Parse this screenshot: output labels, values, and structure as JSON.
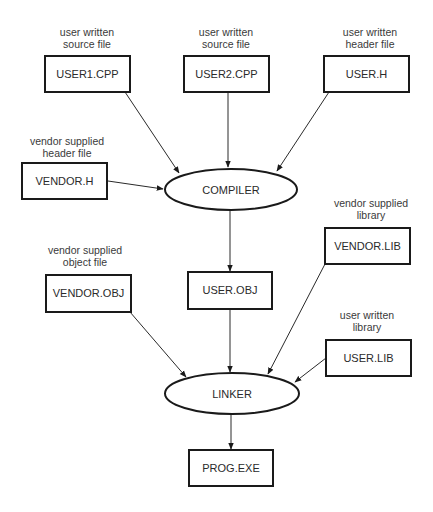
{
  "diagram": {
    "type": "flowchart",
    "title": "",
    "nodes": {
      "user1_cpp": {
        "label": "USER1.CPP",
        "shape": "rect",
        "caption": [
          "user written",
          "source file"
        ]
      },
      "user2_cpp": {
        "label": "USER2.CPP",
        "shape": "rect",
        "caption": [
          "user written",
          "source file"
        ]
      },
      "user_h": {
        "label": "USER.H",
        "shape": "rect",
        "caption": [
          "user written",
          "header file"
        ]
      },
      "vendor_h": {
        "label": "VENDOR.H",
        "shape": "rect",
        "caption": [
          "vendor supplied",
          "header file"
        ]
      },
      "compiler": {
        "label": "COMPILER",
        "shape": "ellipse"
      },
      "vendor_lib": {
        "label": "VENDOR.LIB",
        "shape": "rect",
        "caption": [
          "vendor supplied",
          "library"
        ]
      },
      "vendor_obj": {
        "label": "VENDOR.OBJ",
        "shape": "rect",
        "caption": [
          "vendor supplied",
          "object file"
        ]
      },
      "user_obj": {
        "label": "USER.OBJ",
        "shape": "rect"
      },
      "user_lib": {
        "label": "USER.LIB",
        "shape": "rect",
        "caption": [
          "user written",
          "library"
        ]
      },
      "linker": {
        "label": "LINKER",
        "shape": "ellipse"
      },
      "prog_exe": {
        "label": "PROG.EXE",
        "shape": "rect"
      }
    },
    "edges": [
      {
        "from": "USER1.CPP",
        "to": "COMPILER"
      },
      {
        "from": "USER2.CPP",
        "to": "COMPILER"
      },
      {
        "from": "USER.H",
        "to": "COMPILER"
      },
      {
        "from": "VENDOR.H",
        "to": "COMPILER"
      },
      {
        "from": "COMPILER",
        "to": "USER.OBJ"
      },
      {
        "from": "VENDOR.OBJ",
        "to": "LINKER"
      },
      {
        "from": "USER.OBJ",
        "to": "LINKER"
      },
      {
        "from": "VENDOR.LIB",
        "to": "LINKER"
      },
      {
        "from": "USER.LIB",
        "to": "LINKER"
      },
      {
        "from": "LINKER",
        "to": "PROG.EXE"
      }
    ]
  },
  "colors": {
    "stroke": "#1a1a1a",
    "text": "#2a2a2a",
    "background": "#ffffff"
  }
}
